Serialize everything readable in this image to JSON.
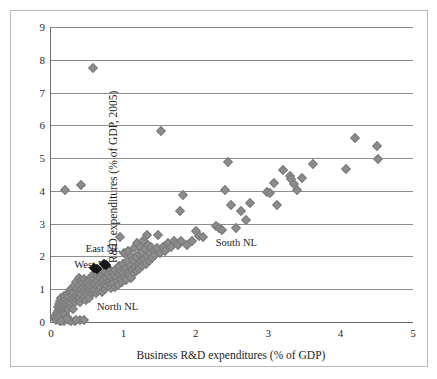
{
  "chart_data": {
    "type": "scatter",
    "title": "",
    "xlabel": "Business R&D expenditures (% of GDP)",
    "ylabel": "Total R&D expenditures (% of GDP, 2005)",
    "xlim": [
      0,
      5
    ],
    "ylim": [
      0,
      9
    ],
    "xticks": [
      0,
      1,
      2,
      3,
      4,
      5
    ],
    "yticks": [
      0,
      1,
      2,
      3,
      4,
      5,
      6,
      7,
      8,
      9
    ],
    "xtick_labels": [
      "0",
      "1",
      "2",
      "3",
      "4",
      "5"
    ],
    "ytick_labels": [
      "0",
      "1",
      "2",
      "3",
      "4",
      "5",
      "6",
      "7",
      "8",
      "9"
    ],
    "grid": "horizontal",
    "legend": "none",
    "marker": "diamond",
    "marker_color": "#8c8c8c",
    "highlight_color": "#141414",
    "annotations": [
      {
        "text": "East NL",
        "x": 0.72,
        "y": 2.22
      },
      {
        "text": "West NL",
        "x": 0.58,
        "y": 1.73
      },
      {
        "text": "North NL",
        "x": 0.92,
        "y": 0.47
      },
      {
        "text": "South NL",
        "x": 2.56,
        "y": 2.42
      }
    ],
    "series": [
      {
        "name": "Regions",
        "color": "#8c8c8c",
        "points": [
          [
            0.05,
            0.1
          ],
          [
            0.06,
            0.18
          ],
          [
            0.07,
            0.06
          ],
          [
            0.08,
            0.26
          ],
          [
            0.09,
            0.34
          ],
          [
            0.1,
            0.14
          ],
          [
            0.1,
            0.45
          ],
          [
            0.11,
            0.55
          ],
          [
            0.12,
            0.3
          ],
          [
            0.12,
            0.64
          ],
          [
            0.13,
            0.22
          ],
          [
            0.14,
            0.42
          ],
          [
            0.14,
            0.72
          ],
          [
            0.15,
            0.33
          ],
          [
            0.15,
            0.52
          ],
          [
            0.16,
            0.12
          ],
          [
            0.17,
            0.61
          ],
          [
            0.17,
            0.28
          ],
          [
            0.18,
            0.46
          ],
          [
            0.18,
            0.8
          ],
          [
            0.19,
            0.36
          ],
          [
            0.2,
            0.58
          ],
          [
            0.2,
            0.24
          ],
          [
            0.21,
            0.69
          ],
          [
            0.21,
            0.44
          ],
          [
            0.22,
            0.86
          ],
          [
            0.22,
            0.16
          ],
          [
            0.23,
            0.54
          ],
          [
            0.24,
            0.75
          ],
          [
            0.24,
            0.39
          ],
          [
            0.25,
            0.63
          ],
          [
            0.26,
            0.92
          ],
          [
            0.26,
            0.48
          ],
          [
            0.27,
            0.71
          ],
          [
            0.28,
            0.57
          ],
          [
            0.28,
            1.0
          ],
          [
            0.29,
            0.82
          ],
          [
            0.3,
            0.66
          ],
          [
            0.3,
            0.41
          ],
          [
            0.31,
            0.9
          ],
          [
            0.32,
            0.74
          ],
          [
            0.32,
            1.1
          ],
          [
            0.33,
            0.6
          ],
          [
            0.34,
            0.98
          ],
          [
            0.34,
            0.79
          ],
          [
            0.35,
            1.23
          ],
          [
            0.36,
            0.68
          ],
          [
            0.36,
            1.05
          ],
          [
            0.37,
            0.88
          ],
          [
            0.38,
            1.34
          ],
          [
            0.38,
            0.73
          ],
          [
            0.39,
            1.14
          ],
          [
            0.4,
            0.95
          ],
          [
            0.4,
            0.62
          ],
          [
            0.41,
            1.28
          ],
          [
            0.42,
            1.02
          ],
          [
            0.42,
            0.84
          ],
          [
            0.43,
            1.18
          ],
          [
            0.44,
            0.7
          ],
          [
            0.44,
            1.08
          ],
          [
            0.45,
            0.93
          ],
          [
            0.46,
            1.3
          ],
          [
            0.46,
            0.77
          ],
          [
            0.47,
            1.12
          ],
          [
            0.48,
            0.99
          ],
          [
            0.48,
            0.66
          ],
          [
            0.49,
            1.22
          ],
          [
            0.5,
            1.06
          ],
          [
            0.5,
            0.86
          ],
          [
            0.51,
            1.16
          ],
          [
            0.52,
            0.95
          ],
          [
            0.52,
            0.72
          ],
          [
            0.53,
            1.26
          ],
          [
            0.54,
            1.09
          ],
          [
            0.55,
            0.89
          ],
          [
            0.55,
            1.38
          ],
          [
            0.56,
            1.02
          ],
          [
            0.57,
            1.2
          ],
          [
            0.58,
            0.93
          ],
          [
            0.58,
            1.44
          ],
          [
            0.59,
            1.12
          ],
          [
            0.6,
            0.99
          ],
          [
            0.6,
            1.3
          ],
          [
            0.61,
            1.18
          ],
          [
            0.62,
            0.88
          ],
          [
            0.63,
            1.4
          ],
          [
            0.63,
            1.08
          ],
          [
            0.64,
            1.25
          ],
          [
            0.65,
            0.96
          ],
          [
            0.66,
            1.5
          ],
          [
            0.66,
            1.14
          ],
          [
            0.67,
            1.33
          ],
          [
            0.68,
            1.05
          ],
          [
            0.69,
            1.22
          ],
          [
            0.7,
            1.44
          ],
          [
            0.7,
            0.92
          ],
          [
            0.71,
            1.58
          ],
          [
            0.72,
            1.28
          ],
          [
            0.73,
            1.12
          ],
          [
            0.74,
            1.38
          ],
          [
            0.75,
            1.02
          ],
          [
            0.75,
            1.52
          ],
          [
            0.76,
            1.2
          ],
          [
            0.77,
            1.34
          ],
          [
            0.78,
            1.09
          ],
          [
            0.79,
            1.46
          ],
          [
            0.8,
            1.26
          ],
          [
            0.8,
            1.62
          ],
          [
            0.81,
            1.15
          ],
          [
            0.82,
            1.38
          ],
          [
            0.83,
            1.05
          ],
          [
            0.84,
            1.52
          ],
          [
            0.85,
            1.3
          ],
          [
            0.86,
            1.18
          ],
          [
            0.87,
            1.44
          ],
          [
            0.88,
            1.08
          ],
          [
            0.89,
            1.6
          ],
          [
            0.9,
            1.36
          ],
          [
            0.91,
            1.24
          ],
          [
            0.92,
            1.5
          ],
          [
            0.93,
            1.14
          ],
          [
            0.94,
            1.7
          ],
          [
            0.95,
            1.42
          ],
          [
            0.95,
            2.58
          ],
          [
            0.96,
            1.3
          ],
          [
            0.97,
            1.56
          ],
          [
            0.98,
            1.22
          ],
          [
            0.99,
            1.78
          ],
          [
            1.0,
            1.48
          ],
          [
            1.01,
            2.12
          ],
          [
            1.02,
            1.36
          ],
          [
            1.03,
            1.64
          ],
          [
            1.04,
            1.28
          ],
          [
            1.05,
            1.86
          ],
          [
            1.06,
            1.54
          ],
          [
            1.07,
            2.18
          ],
          [
            1.08,
            1.42
          ],
          [
            1.09,
            1.72
          ],
          [
            1.1,
            1.34
          ],
          [
            1.11,
            2.02
          ],
          [
            1.12,
            1.6
          ],
          [
            1.13,
            1.9
          ],
          [
            1.14,
            1.48
          ],
          [
            1.15,
            2.26
          ],
          [
            1.16,
            1.68
          ],
          [
            1.17,
            1.98
          ],
          [
            1.18,
            1.55
          ],
          [
            1.19,
            2.42
          ],
          [
            1.2,
            1.76
          ],
          [
            1.21,
            2.08
          ],
          [
            1.22,
            1.62
          ],
          [
            1.23,
            2.3
          ],
          [
            1.24,
            1.84
          ],
          [
            1.25,
            2.14
          ],
          [
            1.26,
            1.7
          ],
          [
            1.27,
            2.46
          ],
          [
            1.28,
            1.92
          ],
          [
            1.3,
            2.22
          ],
          [
            1.31,
            1.78
          ],
          [
            1.32,
            2.66
          ],
          [
            1.33,
            2.0
          ],
          [
            1.34,
            2.34
          ],
          [
            1.35,
            1.86
          ],
          [
            1.37,
            2.1
          ],
          [
            1.38,
            2.28
          ],
          [
            1.4,
            1.94
          ],
          [
            1.42,
            2.18
          ],
          [
            1.44,
            2.04
          ],
          [
            1.46,
            2.26
          ],
          [
            1.48,
            2.66
          ],
          [
            1.5,
            2.12
          ],
          [
            1.52,
            5.82
          ],
          [
            1.55,
            2.3
          ],
          [
            1.58,
            2.18
          ],
          [
            1.62,
            2.42
          ],
          [
            1.66,
            2.3
          ],
          [
            1.7,
            2.48
          ],
          [
            1.72,
            2.4
          ],
          [
            1.75,
            2.34
          ],
          [
            1.78,
            3.38
          ],
          [
            1.8,
            2.46
          ],
          [
            1.83,
            3.86
          ],
          [
            1.88,
            2.34
          ],
          [
            1.95,
            2.46
          ],
          [
            2.0,
            2.78
          ],
          [
            2.05,
            2.62
          ],
          [
            2.1,
            2.58
          ],
          [
            2.28,
            2.94
          ],
          [
            2.32,
            2.88
          ],
          [
            2.36,
            2.82
          ],
          [
            2.4,
            4.04
          ],
          [
            2.45,
            4.88
          ],
          [
            2.48,
            3.57
          ],
          [
            2.55,
            2.88
          ],
          [
            2.62,
            3.38
          ],
          [
            2.7,
            3.1
          ],
          [
            2.75,
            3.64
          ],
          [
            2.98,
            3.98
          ],
          [
            3.02,
            3.94
          ],
          [
            3.08,
            4.24
          ],
          [
            3.12,
            3.56
          ],
          [
            3.2,
            4.64
          ],
          [
            3.3,
            4.44
          ],
          [
            3.32,
            4.36
          ],
          [
            3.35,
            4.2
          ],
          [
            3.4,
            4.04
          ],
          [
            3.46,
            4.38
          ],
          [
            3.62,
            4.82
          ],
          [
            4.08,
            4.68
          ],
          [
            4.2,
            5.62
          ],
          [
            4.5,
            5.36
          ],
          [
            4.52,
            4.98
          ],
          [
            0.2,
            4.02
          ],
          [
            0.42,
            4.18
          ],
          [
            0.58,
            7.74
          ],
          [
            0.12,
            0.04
          ],
          [
            0.18,
            0.03
          ],
          [
            0.25,
            0.05
          ],
          [
            0.33,
            0.04
          ],
          [
            0.4,
            0.05
          ],
          [
            0.28,
            0.03
          ],
          [
            0.22,
            0.08
          ],
          [
            0.35,
            0.07
          ],
          [
            0.45,
            0.06
          ],
          [
            0.14,
            0.02
          ]
        ]
      },
      {
        "name": "Highlighted regions",
        "color": "#141414",
        "points": [
          [
            0.6,
            1.65
          ],
          [
            0.63,
            1.63
          ],
          [
            0.73,
            1.77
          ],
          [
            0.76,
            1.75
          ]
        ]
      }
    ]
  }
}
